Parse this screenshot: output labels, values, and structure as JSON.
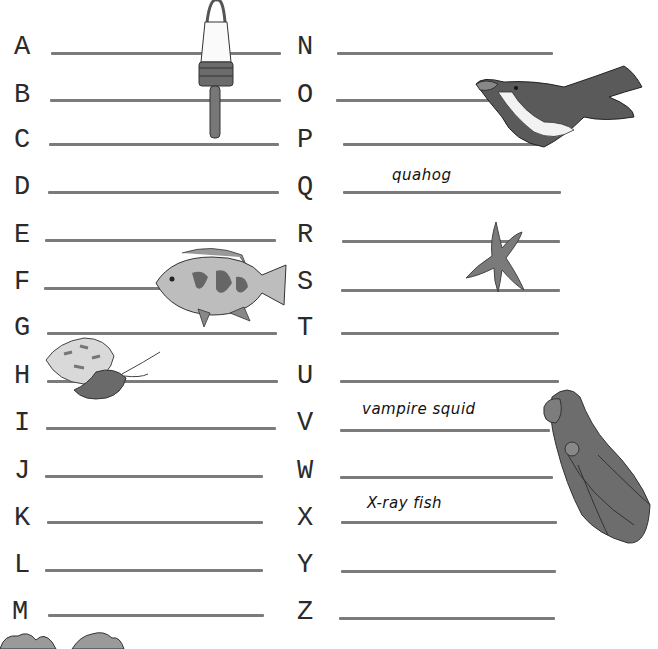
{
  "worksheet": {
    "left_column": [
      {
        "letter": "A",
        "answer": ""
      },
      {
        "letter": "B",
        "answer": ""
      },
      {
        "letter": "C",
        "answer": ""
      },
      {
        "letter": "D",
        "answer": ""
      },
      {
        "letter": "E",
        "answer": ""
      },
      {
        "letter": "F",
        "answer": ""
      },
      {
        "letter": "G",
        "answer": ""
      },
      {
        "letter": "H",
        "answer": ""
      },
      {
        "letter": "I",
        "answer": ""
      },
      {
        "letter": "J",
        "answer": ""
      },
      {
        "letter": "K",
        "answer": ""
      },
      {
        "letter": "L",
        "answer": ""
      },
      {
        "letter": "M",
        "answer": ""
      }
    ],
    "right_column": [
      {
        "letter": "N",
        "answer": ""
      },
      {
        "letter": "O",
        "answer": ""
      },
      {
        "letter": "P",
        "answer": ""
      },
      {
        "letter": "Q",
        "answer": "quahog"
      },
      {
        "letter": "R",
        "answer": ""
      },
      {
        "letter": "S",
        "answer": ""
      },
      {
        "letter": "T",
        "answer": ""
      },
      {
        "letter": "U",
        "answer": ""
      },
      {
        "letter": "V",
        "answer": "vampire squid"
      },
      {
        "letter": "W",
        "answer": ""
      },
      {
        "letter": "X",
        "answer": "X-ray fish"
      },
      {
        "letter": "Y",
        "answer": ""
      },
      {
        "letter": "Z",
        "answer": ""
      }
    ],
    "illustrations": [
      "lobster-buoy",
      "penguin",
      "starfish",
      "fish",
      "hermit-crab",
      "vampire-squid",
      "coral"
    ]
  }
}
